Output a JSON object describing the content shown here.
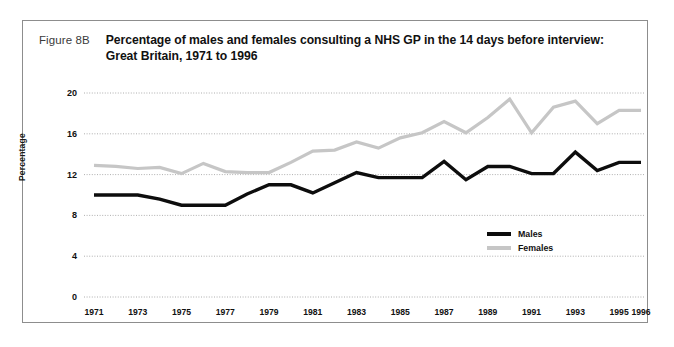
{
  "figure": {
    "number": "Figure 8B",
    "title": "Percentage of males and females consulting a NHS GP in the 14 days before interview: Great Britain, 1971 to 1996"
  },
  "legend": {
    "males_label": "Males",
    "females_label": "Females"
  },
  "colors": {
    "males_line": "#0d0d0d",
    "females_line": "#c6c6c6",
    "gridline": "#9a9a9a",
    "frame_border": "#8d8d8d",
    "text": "#111111"
  },
  "chart_data": {
    "type": "line",
    "title": "Percentage of males and females consulting a NHS GP in the 14 days before interview: Great Britain, 1971 to 1996",
    "xlabel": "",
    "ylabel": "Percentage",
    "ylim": [
      0,
      20
    ],
    "xlim": [
      1971,
      1996
    ],
    "yticks": [
      0,
      4,
      8,
      12,
      16,
      20
    ],
    "ytick_labels": [
      "0",
      "4",
      "8",
      "12",
      "16",
      "20"
    ],
    "xticks": [
      1971,
      1973,
      1975,
      1977,
      1979,
      1981,
      1983,
      1985,
      1987,
      1989,
      1991,
      1993,
      1995,
      1996
    ],
    "xtick_labels": [
      "1971",
      "1973",
      "1975",
      "1977",
      "1979",
      "1981",
      "1983",
      "1985",
      "1987",
      "1989",
      "1991",
      "1993",
      "1995",
      "1996"
    ],
    "grid": true,
    "grid_axis": "y",
    "legend_position": "center-right-inside",
    "x": [
      1971,
      1972,
      1973,
      1974,
      1975,
      1976,
      1977,
      1978,
      1979,
      1980,
      1981,
      1982,
      1983,
      1984,
      1985,
      1986,
      1987,
      1988,
      1989,
      1990,
      1991,
      1992,
      1993,
      1994,
      1995,
      1996
    ],
    "series": [
      {
        "name": "Males",
        "color": "#0d0d0d",
        "values": [
          10.0,
          10.0,
          10.0,
          9.6,
          9.0,
          9.0,
          9.0,
          10.1,
          11.0,
          11.0,
          10.2,
          11.2,
          12.2,
          11.7,
          11.7,
          11.7,
          13.3,
          11.5,
          12.8,
          12.8,
          12.1,
          12.1,
          14.2,
          12.4,
          13.2,
          13.2
        ]
      },
      {
        "name": "Females",
        "color": "#c6c6c6",
        "values": [
          12.9,
          12.8,
          12.6,
          12.7,
          12.1,
          13.1,
          12.3,
          12.2,
          12.2,
          13.2,
          14.3,
          14.4,
          15.2,
          14.6,
          15.6,
          16.1,
          17.2,
          16.1,
          17.6,
          19.4,
          16.1,
          18.6,
          19.2,
          17.0,
          18.3,
          18.3
        ]
      }
    ]
  }
}
